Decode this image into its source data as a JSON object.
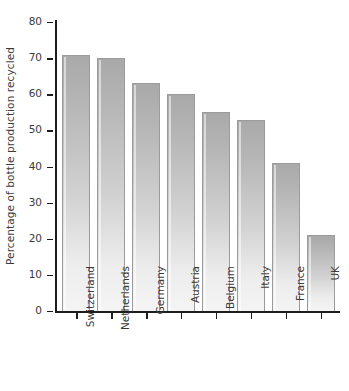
{
  "chart_data": {
    "type": "bar",
    "title": "",
    "subtitle": "",
    "xlabel": "",
    "ylabel": "Percentage of bottle production recycled",
    "categories": [
      "Switzerland",
      "Netherlands",
      "Germany",
      "Austria",
      "Belgium",
      "Italy",
      "France",
      "UK"
    ],
    "values": [
      71,
      70,
      63,
      60,
      55,
      53,
      41,
      21
    ],
    "series": [
      {
        "name": "Percentage of bottle production recycled",
        "values": [
          71,
          70,
          63,
          60,
          55,
          53,
          41,
          21
        ]
      }
    ],
    "ylim": [
      0,
      80
    ],
    "y_ticks": [
      0,
      10,
      20,
      30,
      40,
      50,
      60,
      70,
      80
    ],
    "y_tick_labels": [
      "0",
      "10",
      "20",
      "30",
      "40",
      "50",
      "60",
      "70",
      "80"
    ],
    "grid": false,
    "legend": false,
    "legend_position": "none",
    "annotations": [],
    "bar_fill_top_color": "#a9a9a9",
    "bar_fill_bottom_color": "#f4f4f4",
    "bar_border_color": "#9b9b9b",
    "axis_color": "#1d1d1d",
    "text_color": "#3a3a3a",
    "background_color": "#ffffff"
  }
}
